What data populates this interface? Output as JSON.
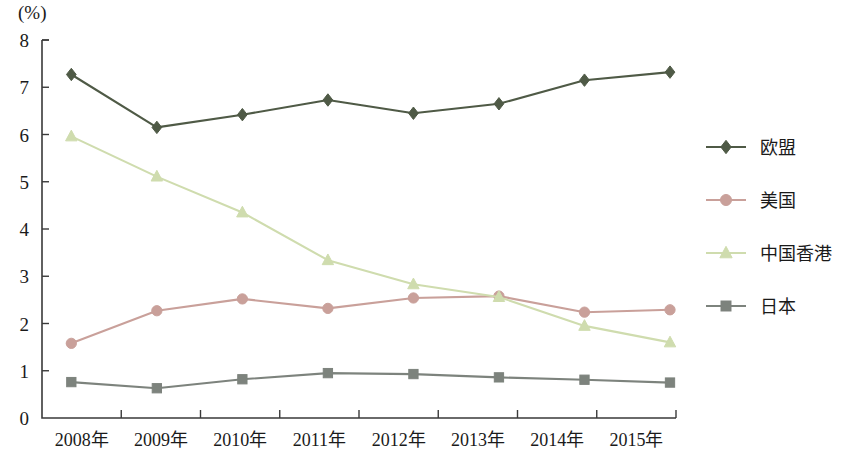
{
  "axis": {
    "unit_label": "(%)",
    "y_ticks": [
      "0",
      "1",
      "2",
      "3",
      "4",
      "5",
      "6",
      "7",
      "8"
    ],
    "x_ticks": [
      "2008年",
      "2009年",
      "2010年",
      "2011年",
      "2012年",
      "2013年",
      "2014年",
      "2015年"
    ]
  },
  "legend": {
    "items": [
      {
        "label": "欧盟",
        "color": "#4f5a46",
        "marker": "diamond"
      },
      {
        "label": "美国",
        "color": "#c9a09a",
        "marker": "circle"
      },
      {
        "label": "中国香港",
        "color": "#cfdcae",
        "marker": "triangle"
      },
      {
        "label": "日本",
        "color": "#7d837d",
        "marker": "square"
      }
    ]
  },
  "chart_data": {
    "type": "line",
    "title": "",
    "subtitle": "",
    "xlabel": "",
    "ylabel": "(%)",
    "categories": [
      "2008年",
      "2009年",
      "2010年",
      "2011年",
      "2012年",
      "2013年",
      "2014年",
      "2015年"
    ],
    "ylim": [
      0,
      8
    ],
    "ytick_step": 1,
    "grid": false,
    "legend_position": "right",
    "series": [
      {
        "name": "欧盟",
        "color": "#4f5a46",
        "marker": "diamond",
        "values": [
          7.27,
          6.15,
          6.42,
          6.73,
          6.45,
          6.65,
          7.15,
          7.32
        ]
      },
      {
        "name": "美国",
        "color": "#c9a09a",
        "marker": "circle",
        "values": [
          1.58,
          2.27,
          2.52,
          2.32,
          2.54,
          2.58,
          2.24,
          2.29
        ]
      },
      {
        "name": "中国香港",
        "color": "#cfdcae",
        "marker": "triangle",
        "values": [
          5.96,
          5.11,
          4.35,
          3.34,
          2.83,
          2.56,
          1.95,
          1.6
        ]
      },
      {
        "name": "日本",
        "color": "#7d837d",
        "marker": "square",
        "values": [
          0.76,
          0.63,
          0.82,
          0.95,
          0.93,
          0.86,
          0.81,
          0.75
        ]
      }
    ]
  }
}
